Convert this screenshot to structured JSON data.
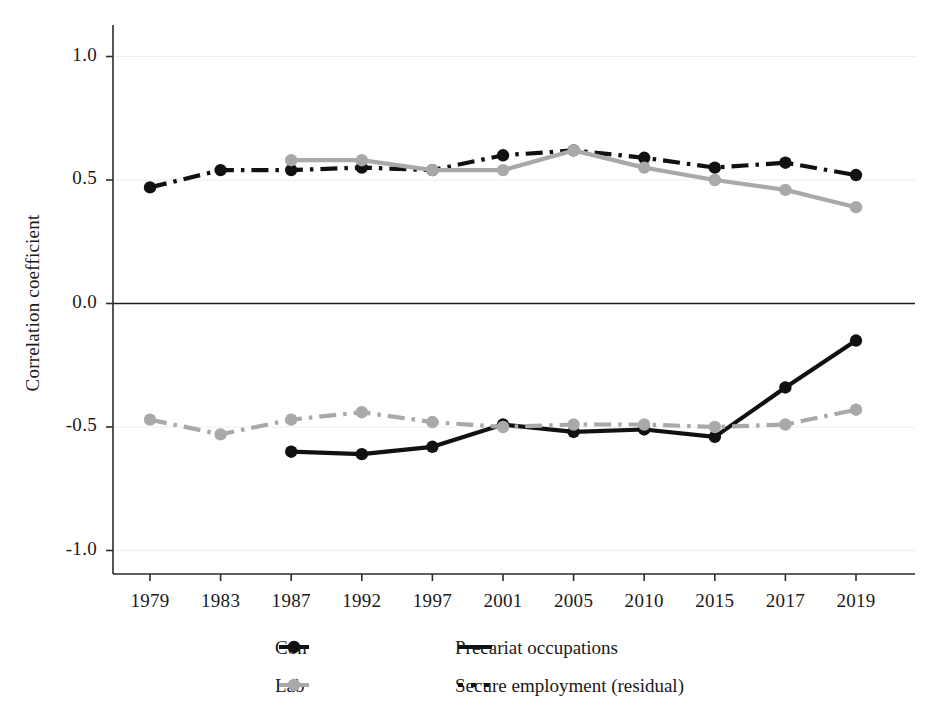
{
  "chart_data": {
    "type": "line",
    "title": "",
    "xlabel": "",
    "ylabel": "Correlation coefficient",
    "categories": [
      "1979",
      "1983",
      "1987",
      "1992",
      "1997",
      "2001",
      "2005",
      "2010",
      "2015",
      "2017",
      "2019"
    ],
    "ylim": [
      -1.15,
      1.1
    ],
    "yticks": [
      1.0,
      0.5,
      0.0,
      -0.5,
      -1.0
    ],
    "ytick_labels": [
      "1.0",
      "0.5",
      "0.0",
      "-0.5",
      "-1.0"
    ],
    "grid": "horizontal-light",
    "zero_line": true,
    "legend_position": "bottom",
    "series": [
      {
        "name": "Con — Secure employment (residual)",
        "party": "Con",
        "measure": "Secure employment (residual)",
        "color": "#111111",
        "style": "dash-dot",
        "marker": "circle",
        "values": [
          0.47,
          0.54,
          0.54,
          0.55,
          0.54,
          0.6,
          0.62,
          0.59,
          0.55,
          0.57,
          0.52
        ]
      },
      {
        "name": "Lab — Secure employment (residual)",
        "party": "Lab",
        "measure": "Secure employment (residual)",
        "color": "#a9a9a9",
        "style": "solid",
        "marker": "circle",
        "values": [
          null,
          null,
          0.58,
          0.58,
          0.54,
          0.54,
          0.62,
          0.55,
          0.5,
          0.46,
          0.39
        ]
      },
      {
        "name": "Con — Precariat occupations",
        "party": "Con",
        "measure": "Precariat occupations",
        "color": "#111111",
        "style": "solid",
        "marker": "circle",
        "values": [
          null,
          null,
          -0.6,
          -0.61,
          -0.58,
          -0.49,
          -0.52,
          -0.51,
          -0.54,
          -0.34,
          -0.15
        ]
      },
      {
        "name": "Lab — Precariat occupations",
        "party": "Lab",
        "measure": "Precariat occupations",
        "color": "#a9a9a9",
        "style": "dash-dot",
        "marker": "circle",
        "values": [
          -0.47,
          -0.53,
          -0.47,
          -0.44,
          -0.48,
          -0.5,
          -0.49,
          -0.49,
          -0.5,
          -0.49,
          -0.43
        ]
      }
    ]
  },
  "legend": {
    "entries": [
      {
        "label": "Con",
        "kind": "marker",
        "color": "#111111",
        "icon": "circle-marker-icon"
      },
      {
        "label": "Lab",
        "kind": "marker",
        "color": "#a9a9a9",
        "icon": "circle-marker-icon"
      },
      {
        "label": "Precariat occupations",
        "kind": "line",
        "color": "#111111",
        "icon": "solid-line-icon"
      },
      {
        "label": "Secure employment (residual)",
        "kind": "line",
        "color": "#111111",
        "icon": "dash-dot-line-icon"
      }
    ]
  },
  "colors": {
    "con": "#111111",
    "lab": "#a9a9a9",
    "axis": "#2b2b2b",
    "grid": "#eeeeee",
    "background": "#ffffff"
  }
}
